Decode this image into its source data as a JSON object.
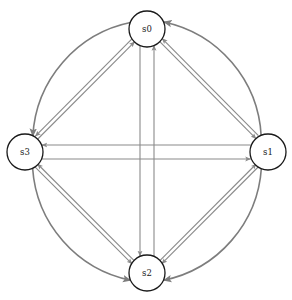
{
  "diagram": {
    "type": "directed-state-transition-graph",
    "title": "",
    "canvas": {
      "width": 292,
      "height": 300,
      "background": "#ffffff"
    },
    "style": {
      "node_stroke": "#1a1a1a",
      "node_fill": "#ffffff",
      "node_stroke_width": 1.3,
      "node_radius": 18,
      "edge_color": "#8a8a8a",
      "edge_color_dark": "#7d7d7d",
      "edge_width_straight": 1.1,
      "edge_width_curved": 1.6,
      "arrowhead_color": "#8a8a8a",
      "label_color": "#1a1a1a",
      "label_font_size": 8.5
    },
    "layout": {
      "center_x": 146,
      "center_y": 152,
      "ring_radius": 123
    },
    "nodes": [
      {
        "id": "s0",
        "label": "s0",
        "cx": 147,
        "cy": 29,
        "r": 18,
        "position": "top"
      },
      {
        "id": "s1",
        "label": "s1",
        "cx": 268,
        "cy": 152,
        "r": 18,
        "position": "right"
      },
      {
        "id": "s2",
        "label": "s2",
        "cx": 147,
        "cy": 273,
        "r": 18,
        "position": "bottom"
      },
      {
        "id": "s3",
        "label": "s3",
        "cx": 25,
        "cy": 152,
        "r": 18,
        "position": "left"
      }
    ],
    "edges": [
      {
        "id": "e-s0-s3-arc",
        "from": "s0",
        "to": "s3",
        "shape": "arc",
        "label": ""
      },
      {
        "id": "e-s3-s0-line",
        "from": "s3",
        "to": "s0",
        "shape": "straight",
        "label": ""
      },
      {
        "id": "e-s1-s0-arc",
        "from": "s1",
        "to": "s0",
        "shape": "arc",
        "label": ""
      },
      {
        "id": "e-s0-s1-line",
        "from": "s0",
        "to": "s1",
        "shape": "straight",
        "label": ""
      },
      {
        "id": "e-s1-s2-arc",
        "from": "s1",
        "to": "s2",
        "shape": "arc",
        "label": ""
      },
      {
        "id": "e-s2-s1-line",
        "from": "s2",
        "to": "s1",
        "shape": "straight",
        "label": ""
      },
      {
        "id": "e-s3-s2-arc",
        "from": "s3",
        "to": "s2",
        "shape": "arc",
        "label": ""
      },
      {
        "id": "e-s2-s3-line",
        "from": "s2",
        "to": "s3",
        "shape": "straight",
        "label": ""
      },
      {
        "id": "e-s0-s2-line",
        "from": "s0",
        "to": "s2",
        "shape": "straight",
        "label": ""
      },
      {
        "id": "e-s2-s0-line",
        "from": "s2",
        "to": "s0",
        "shape": "straight",
        "label": ""
      },
      {
        "id": "e-s3-s1-line",
        "from": "s3",
        "to": "s1",
        "shape": "straight",
        "label": ""
      },
      {
        "id": "e-s1-s3-line",
        "from": "s1",
        "to": "s3",
        "shape": "straight",
        "label": ""
      }
    ]
  }
}
